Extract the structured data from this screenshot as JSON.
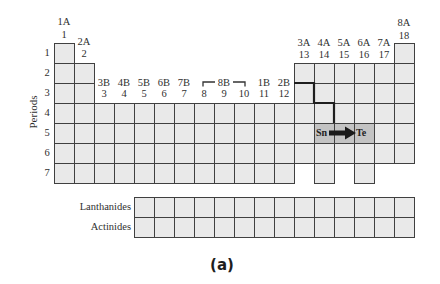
{
  "figure": {
    "label": "(a)",
    "axis_label": "Periods"
  },
  "groups": [
    {
      "old": "1A",
      "new": "1"
    },
    {
      "old": "2A",
      "new": "2"
    },
    {
      "old": "3B",
      "new": "3"
    },
    {
      "old": "4B",
      "new": "4"
    },
    {
      "old": "5B",
      "new": "5"
    },
    {
      "old": "6B",
      "new": "6"
    },
    {
      "old": "7B",
      "new": "7"
    },
    {
      "old": "",
      "new": "8"
    },
    {
      "old": "",
      "new": "9"
    },
    {
      "old": "",
      "new": "10"
    },
    {
      "old": "1B",
      "new": "11"
    },
    {
      "old": "2B",
      "new": "12"
    },
    {
      "old": "3A",
      "new": "13"
    },
    {
      "old": "4A",
      "new": "14"
    },
    {
      "old": "5A",
      "new": "15"
    },
    {
      "old": "6A",
      "new": "16"
    },
    {
      "old": "7A",
      "new": "17"
    },
    {
      "old": "8A",
      "new": "18"
    }
  ],
  "group_8_10_label": "8B",
  "periods": [
    "1",
    "2",
    "3",
    "4",
    "5",
    "6",
    "7"
  ],
  "f_block": {
    "lanthanides": "Lanthanides",
    "actinides": "Actinides",
    "ranges": [
      [
        5,
        18
      ]
    ]
  },
  "highlight": {
    "from": "Sn",
    "to": "Te",
    "shaded_cells": [
      [
        5,
        14
      ],
      [
        5,
        15
      ],
      [
        5,
        16
      ]
    ]
  },
  "grid": {
    "rows": [
      {
        "period": 1,
        "ranges": [
          [
            1,
            1
          ],
          [
            18,
            18
          ]
        ]
      },
      {
        "period": 2,
        "ranges": [
          [
            1,
            2
          ],
          [
            13,
            18
          ]
        ]
      },
      {
        "period": 3,
        "ranges": [
          [
            1,
            2
          ],
          [
            13,
            18
          ]
        ]
      },
      {
        "period": 4,
        "ranges": [
          [
            1,
            18
          ]
        ]
      },
      {
        "period": 5,
        "ranges": [
          [
            1,
            18
          ]
        ]
      },
      {
        "period": 6,
        "ranges": [
          [
            1,
            18
          ]
        ]
      },
      {
        "period": 7,
        "ranges": [
          [
            1,
            12
          ],
          [
            14,
            14
          ],
          [
            16,
            16
          ]
        ]
      }
    ]
  },
  "colors": {
    "cell_fill": "#e9e9e9",
    "shaded_fill": "#c3c3c3",
    "grid_line": "#404040",
    "arrow": "#1a1a1a"
  }
}
